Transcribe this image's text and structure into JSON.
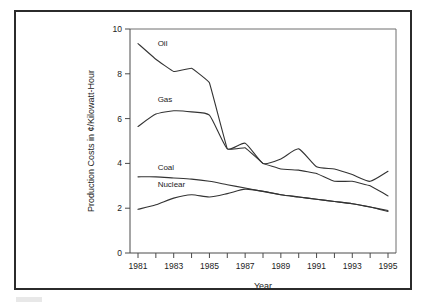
{
  "figure": {
    "background_color": "#ffffff",
    "frame_color": "#2b2b2b",
    "line_color": "#333333"
  },
  "chart_data": {
    "type": "line",
    "title": "",
    "xlabel": "Year",
    "ylabel": "Production Costs in ¢/Kilowatt-Hour",
    "xlim": [
      1981,
      1995
    ],
    "ylim": [
      0,
      10
    ],
    "ytick_values": [
      0,
      2,
      4,
      6,
      8,
      10
    ],
    "ytick_labels": [
      "0",
      "2",
      "4",
      "6",
      "8",
      "10"
    ],
    "xtick_values": [
      1981,
      1982,
      1983,
      1984,
      1985,
      1986,
      1987,
      1988,
      1989,
      1990,
      1991,
      1992,
      1993,
      1994,
      1995
    ],
    "xtick_labels": [
      "1981",
      "",
      "1983",
      "",
      "1985",
      "",
      "1987",
      "",
      "1989",
      "",
      "1991",
      "",
      "1993",
      "",
      "1995"
    ],
    "grid": false,
    "legend": "inline-labels",
    "x": [
      1981,
      1982,
      1983,
      1984,
      1985,
      1986,
      1987,
      1988,
      1989,
      1990,
      1991,
      1992,
      1993,
      1994,
      1995
    ],
    "series": [
      {
        "name": "Oil",
        "label": "Oil",
        "values": [
          9.35,
          8.65,
          8.1,
          8.25,
          7.6,
          4.65,
          4.7,
          4.0,
          3.75,
          3.7,
          3.55,
          3.2,
          3.2,
          3.0,
          2.55
        ]
      },
      {
        "name": "Gas",
        "label": "Gas",
        "values": [
          5.65,
          6.2,
          6.35,
          6.3,
          6.15,
          4.65,
          4.9,
          4.0,
          4.2,
          4.65,
          3.85,
          3.75,
          3.5,
          3.2,
          3.65
        ]
      },
      {
        "name": "Coal",
        "label": "Coal",
        "values": [
          3.4,
          3.4,
          3.35,
          3.3,
          3.2,
          3.05,
          2.9,
          2.75,
          2.6,
          2.5,
          2.4,
          2.3,
          2.2,
          2.05,
          1.9
        ]
      },
      {
        "name": "Nuclear",
        "label": "Nuclear",
        "values": [
          1.95,
          2.15,
          2.45,
          2.6,
          2.5,
          2.65,
          2.85,
          2.75,
          2.6,
          2.5,
          2.4,
          2.3,
          2.2,
          2.05,
          1.85
        ]
      }
    ],
    "series_label_positions": [
      {
        "name": "Oil",
        "x": 1982.1,
        "y": 9.25
      },
      {
        "name": "Gas",
        "x": 1982.1,
        "y": 6.75
      },
      {
        "name": "Coal",
        "x": 1982.1,
        "y": 3.72
      },
      {
        "name": "Nuclear",
        "x": 1982.1,
        "y": 2.95
      }
    ]
  }
}
